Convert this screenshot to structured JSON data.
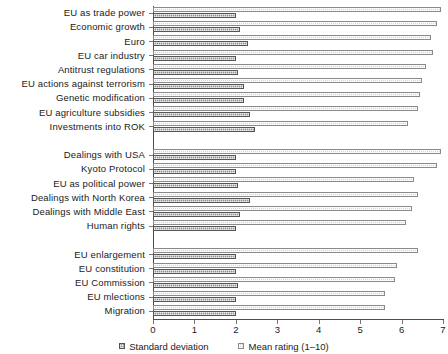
{
  "chart_data": {
    "type": "bar",
    "orientation": "horizontal",
    "title": "",
    "xlabel": "",
    "ylabel": "",
    "xlim": [
      0,
      7
    ],
    "xticks": [
      0,
      1,
      2,
      3,
      4,
      5,
      6,
      7
    ],
    "xtick_labels": [
      "0",
      "1",
      "2",
      "3",
      "4",
      "5",
      "6",
      "7"
    ],
    "grid": false,
    "legend_position": "bottom-center",
    "legend": [
      {
        "name": "Standard deviation",
        "key": "standard_deviation",
        "color": "#8f8f8f"
      },
      {
        "name": "Mean rating (1–10)",
        "key": "mean_rating",
        "color": "#d6d6d6"
      }
    ],
    "series": [
      {
        "name": "Mean rating (1–10)",
        "key": "mean_rating",
        "values": [
          6.95,
          6.85,
          6.7,
          6.75,
          6.6,
          6.5,
          6.45,
          6.4,
          6.15,
          6.95,
          6.85,
          6.3,
          6.4,
          6.25,
          6.1,
          6.4,
          5.9,
          5.85,
          5.6,
          5.6
        ]
      },
      {
        "name": "Standard deviation",
        "key": "standard_deviation",
        "values": [
          2.0,
          2.1,
          2.3,
          2.0,
          2.05,
          2.2,
          2.2,
          2.35,
          2.45,
          2.0,
          2.0,
          2.05,
          2.35,
          2.1,
          2.0,
          2.0,
          2.0,
          2.05,
          2.0,
          2.0
        ]
      }
    ],
    "groups": [
      {
        "id": "group-1",
        "categories": [
          "EU as trade power",
          "Economic growth",
          "Euro",
          "EU car industry",
          "Antitrust regulations",
          "EU actions against terrorism",
          "Genetic modification",
          "EU agriculture subsidies",
          "Investments into ROK"
        ]
      },
      {
        "id": "group-2",
        "categories": [
          "Dealings with USA",
          "Kyoto Protocol",
          "EU as political power",
          "Dealings with North Korea",
          "Dealings with Middle East",
          "Human rights"
        ]
      },
      {
        "id": "group-3",
        "categories": [
          "EU enlargement",
          "EU constitution",
          "EU Commission",
          "EU mlections",
          "Migration"
        ]
      }
    ],
    "categories": [
      "EU as trade power",
      "Economic growth",
      "Euro",
      "EU car industry",
      "Antitrust regulations",
      "EU actions against terrorism",
      "Genetic modification",
      "EU agriculture subsidies",
      "Investments into ROK",
      "Dealings with USA",
      "Kyoto Protocol",
      "EU as political power",
      "Dealings with North Korea",
      "Dealings with Middle East",
      "Human rights",
      "EU enlargement",
      "EU constitution",
      "EU Commission",
      "EU mlections",
      "Migration"
    ]
  }
}
